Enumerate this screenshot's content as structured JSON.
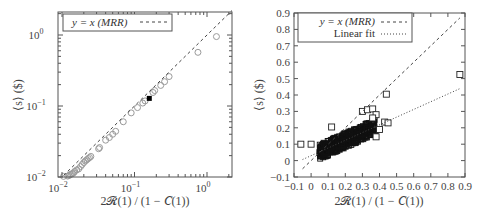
{
  "chart_data": [
    {
      "type": "scatter",
      "panel": "left",
      "xscale": "log",
      "yscale": "log",
      "xlabel": "2R(1) / (1 − C(1))",
      "ylabel": "⟨s⟩ ($)",
      "xlim": [
        0.009,
        1.9
      ],
      "ylim": [
        0.0097,
        2.1
      ],
      "xticks": [
        "10^-2",
        "10^-1",
        "10^0"
      ],
      "yticks": [
        "10^-2",
        "10^-1",
        "10^0"
      ],
      "legend": [
        {
          "label": "y = x (MRR)",
          "style": "dashed"
        }
      ],
      "legend_position": "upper left",
      "series": [
        {
          "name": "data",
          "marker": "circle-gray",
          "points": [
            [
              0.0105,
              0.0102
            ],
            [
              0.012,
              0.0103
            ],
            [
              0.0125,
              0.0105
            ],
            [
              0.013,
              0.0108
            ],
            [
              0.0135,
              0.011
            ],
            [
              0.014,
              0.0112
            ],
            [
              0.0145,
              0.0115
            ],
            [
              0.015,
              0.012
            ],
            [
              0.016,
              0.0126
            ],
            [
              0.017,
              0.013
            ],
            [
              0.018,
              0.014
            ],
            [
              0.019,
              0.015
            ],
            [
              0.02,
              0.016
            ],
            [
              0.021,
              0.0168
            ],
            [
              0.022,
              0.0175
            ],
            [
              0.023,
              0.0182
            ],
            [
              0.024,
              0.0188
            ],
            [
              0.025,
              0.0195
            ],
            [
              0.032,
              0.025
            ],
            [
              0.033,
              0.026
            ],
            [
              0.04,
              0.033
            ],
            [
              0.045,
              0.036
            ],
            [
              0.05,
              0.04
            ],
            [
              0.055,
              0.044
            ],
            [
              0.07,
              0.06
            ],
            [
              0.09,
              0.08
            ],
            [
              0.11,
              0.095
            ],
            [
              0.13,
              0.11
            ],
            [
              0.14,
              0.118
            ],
            [
              0.18,
              0.155
            ],
            [
              0.19,
              0.165
            ],
            [
              0.23,
              0.195
            ],
            [
              0.26,
              0.22
            ],
            [
              0.3,
              0.26
            ],
            [
              0.75,
              0.57
            ],
            [
              1.35,
              0.95
            ]
          ]
        },
        {
          "name": "highlight",
          "marker": "filled-black-square",
          "points": [
            [
              0.16,
              0.128
            ]
          ]
        }
      ],
      "reference_line": {
        "name": "y = x (MRR)",
        "slope": 1,
        "intercept": 0
      }
    },
    {
      "type": "scatter",
      "panel": "right",
      "xlabel": "2R(1) / (1 − C(1))",
      "ylabel": "⟨s⟩ ($)",
      "xlim": [
        -0.1,
        0.9
      ],
      "ylim": [
        -0.1,
        0.9
      ],
      "xticks": [
        "-0.1",
        "0",
        "0.1",
        "0.2",
        "0.3",
        "0.4",
        "0.5",
        "0.6",
        "0.7",
        "0.8",
        "0.9"
      ],
      "yticks": [
        "-0.1",
        "0",
        "0.1",
        "0.2",
        "0.3",
        "0.4",
        "0.5",
        "0.6",
        "0.7",
        "0.8",
        "0.9"
      ],
      "legend": [
        {
          "label": "y = x (MRR)",
          "style": "dashed"
        },
        {
          "label": "Linear fit",
          "style": "dotted"
        }
      ],
      "legend_position": "upper left",
      "series": [
        {
          "name": "data",
          "marker": "open-square",
          "dense_cluster": {
            "x_range": [
              0.05,
              0.38
            ],
            "y_range": [
              0.05,
              0.22
            ],
            "description": "dense blob of several hundred points along fit line"
          },
          "points": [
            [
              -0.06,
              0.1
            ],
            [
              0.0,
              0.1
            ],
            [
              0.12,
              0.205
            ],
            [
              0.3,
              0.3
            ],
            [
              0.33,
              0.31
            ],
            [
              0.36,
              0.315
            ],
            [
              0.38,
              0.28
            ],
            [
              0.36,
              0.26
            ],
            [
              0.4,
              0.19
            ],
            [
              0.38,
              0.145
            ],
            [
              0.44,
              0.405
            ],
            [
              0.43,
              0.235
            ],
            [
              0.45,
              0.23
            ],
            [
              0.87,
              0.525
            ]
          ]
        }
      ],
      "reference_lines": [
        {
          "name": "y = x (MRR)",
          "slope": 1,
          "intercept": 0,
          "x_range": [
            -0.05,
            0.87
          ]
        },
        {
          "name": "Linear fit",
          "slope": 0.47,
          "intercept": 0.03,
          "x_range": [
            -0.05,
            0.87
          ]
        }
      ]
    }
  ],
  "left": {
    "legend_label": "y = x (MRR)",
    "xlabel": "2𝓡(1) / (1 − 𝐶(1))",
    "ylabel": "⟨s⟩ ($)",
    "xtick_base": "10",
    "xtick_exps": [
      "−2",
      "−1",
      "0"
    ],
    "ytick_exps": [
      "−2",
      "−1",
      "0"
    ]
  },
  "right": {
    "legend_labels": [
      "y = x (MRR)",
      "Linear fit"
    ],
    "xlabel": "2𝓡(1) / (1 − 𝐶(1))",
    "ylabel": "⟨s⟩ ($)",
    "ticks": [
      "−0.1",
      "0",
      "0.1",
      "0.2",
      "0.3",
      "0.4",
      "0.5",
      "0.6",
      "0.7",
      "0.8",
      "0.9"
    ]
  },
  "colors": {
    "frame": "#555555",
    "marker_gray": "#9a9a9a",
    "marker_black": "#000000",
    "line": "#444444"
  }
}
